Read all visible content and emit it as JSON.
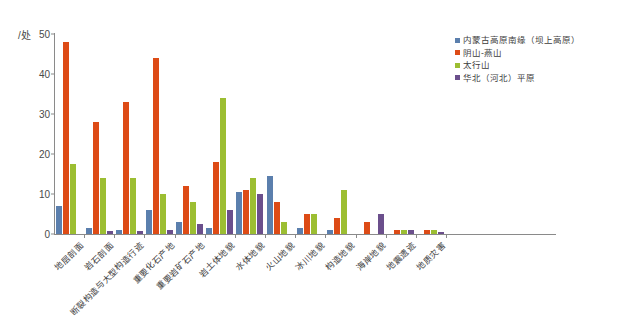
{
  "chart_data": {
    "type": "bar",
    "title": "",
    "subtitle": "",
    "xlabel": "",
    "ylabel": "/处",
    "ylim": [
      0,
      50
    ],
    "ytick_values": [
      0,
      10,
      20,
      30,
      40,
      50
    ],
    "ytick_labels": [
      "0",
      "10",
      "20",
      "30",
      "40",
      "50"
    ],
    "grid": false,
    "legend_position": "top-right",
    "categories": [
      "地层剖面",
      "岩石剖面",
      "断裂构造与大型构造行迹",
      "重要化石产地",
      "重要岩矿石产地",
      "岩土体地貌",
      "水体地貌",
      "火山地貌",
      "冰川地貌",
      "构造地貌",
      "海岸地貌",
      "地震遗迹",
      "地质灾害"
    ],
    "series": [
      {
        "name": "内蒙古高原南缘（坝上高原）",
        "color": "#5b7fad",
        "values": [
          7,
          1.5,
          1,
          6,
          3,
          1.5,
          10.5,
          14.5,
          1.5,
          1,
          0,
          0,
          0
        ]
      },
      {
        "name": "阴山-燕山",
        "color": "#dd4b16",
        "values": [
          48,
          28,
          33,
          44,
          12,
          18,
          11,
          8,
          5,
          4,
          3,
          1,
          1
        ]
      },
      {
        "name": "太行山",
        "color": "#9cbe32",
        "values": [
          17.5,
          14,
          14,
          10,
          8,
          34,
          14,
          3,
          5,
          11,
          0,
          1,
          1
        ]
      },
      {
        "name": "华北（河北）平原",
        "color": "#6b4f8c",
        "values": [
          0,
          0.8,
          0.8,
          1,
          2.5,
          6,
          10,
          0,
          0,
          0,
          5,
          1,
          0.5
        ]
      }
    ]
  }
}
